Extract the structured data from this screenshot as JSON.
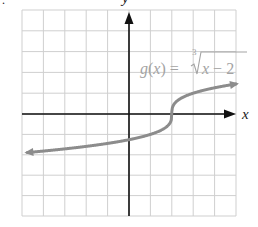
{
  "figure_marker": ".",
  "chart_data": {
    "type": "line",
    "title": "",
    "function_label": "g(x) = ∛(x − 2)",
    "function_label_parts": {
      "lhs": "g(x) =",
      "radical_index": "3",
      "radicand": "x − 2"
    },
    "xlabel": "x",
    "ylabel": "y",
    "xlim": [
      -5,
      5
    ],
    "ylim": [
      -5,
      5
    ],
    "grid": true,
    "grid_step": 1,
    "tick_labels": false,
    "series": [
      {
        "name": "g(x) = cube root of (x - 2)",
        "x": [
          -5,
          -4,
          -3,
          -2,
          -1,
          0,
          1,
          1.5,
          1.9,
          2,
          2.1,
          2.5,
          3,
          4,
          5
        ],
        "values": [
          -1.913,
          -1.817,
          -1.71,
          -1.587,
          -1.442,
          -1.26,
          -1.0,
          -0.794,
          -0.464,
          0,
          0.464,
          0.794,
          1.0,
          1.26,
          1.442
        ],
        "arrows": "both ends",
        "color": "#8c8c8c"
      }
    ],
    "key_point": {
      "x": 2,
      "y": 0
    }
  },
  "colors": {
    "grid": "#cfcfcf",
    "axes": "#111111",
    "curve": "#8c8c8c",
    "label": "#a3a3a3"
  }
}
